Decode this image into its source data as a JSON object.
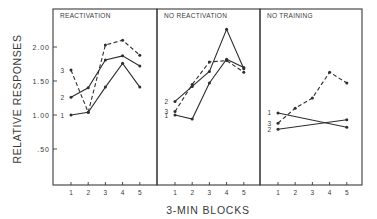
{
  "chart_data": {
    "type": "line",
    "ylabel": "RELATIVE RESPONSES",
    "xlabel": "3-MIN BLOCKS",
    "ylim": [
      0,
      2.45
    ],
    "y_ticks": [
      0.5,
      1.0,
      1.5,
      2.0
    ],
    "y_tick_labels": [
      ".50",
      "1.00",
      "1.50",
      "2.00"
    ],
    "x": [
      1,
      2,
      3,
      4,
      5
    ],
    "x_tick_labels": [
      "1",
      "2",
      "3",
      "4",
      "5"
    ],
    "grid": false,
    "legend": "inline series numbers at left of each line",
    "panels": [
      {
        "title": "REACTIVATION",
        "series": [
          {
            "name": "1",
            "style": "solid",
            "values": [
              1.0,
              1.04,
              1.41,
              1.76,
              1.41
            ]
          },
          {
            "name": "2",
            "style": "solid",
            "values": [
              1.26,
              1.4,
              1.81,
              1.87,
              1.72
            ]
          },
          {
            "name": "3",
            "style": "dashed",
            "values": [
              1.66,
              1.04,
              2.03,
              2.1,
              1.88
            ]
          }
        ]
      },
      {
        "title": "NO REACTIVATION",
        "series": [
          {
            "name": "1",
            "style": "solid",
            "values": [
              1.0,
              0.94,
              1.47,
              1.82,
              1.7
            ]
          },
          {
            "name": "2",
            "style": "solid",
            "values": [
              1.2,
              1.42,
              1.64,
              2.26,
              1.68
            ]
          },
          {
            "name": "3",
            "style": "dashed",
            "values": [
              1.05,
              1.45,
              1.78,
              1.8,
              1.63
            ]
          }
        ]
      },
      {
        "title": "NO TRAINING",
        "series": [
          {
            "name": "1",
            "style": "solid",
            "values": [
              1.03,
              null,
              null,
              null,
              0.82
            ]
          },
          {
            "name": "2",
            "style": "solid",
            "values": [
              0.79,
              null,
              null,
              null,
              0.93
            ]
          },
          {
            "name": "3",
            "style": "dashed",
            "values": [
              0.88,
              1.1,
              1.25,
              1.63,
              1.47
            ]
          }
        ]
      }
    ]
  }
}
